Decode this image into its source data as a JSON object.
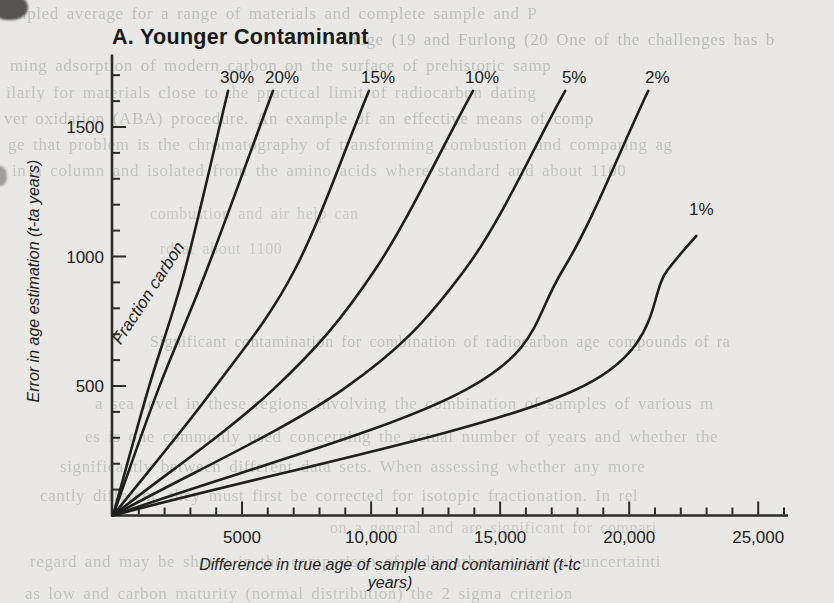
{
  "page": {
    "paper_color": "#e9e8e4",
    "ink_color": "#1f1f1d"
  },
  "chart_data": {
    "type": "line",
    "title": "A. Younger Contaminant",
    "xlabel": "Difference in true age of sample and contaminant (t-tc years)",
    "ylabel": "Error in age estimation (t-ta years)",
    "annotation": "Fraction carbon",
    "xlim": [
      0,
      26000
    ],
    "ylim": [
      0,
      1780
    ],
    "grid": false,
    "legend_position": "labels at upper end of each curve",
    "x_ticks_major": [
      {
        "value": 5000,
        "label": "5000"
      },
      {
        "value": 10000,
        "label": "10,000"
      },
      {
        "value": 15000,
        "label": "15,000"
      },
      {
        "value": 20000,
        "label": "20,000"
      },
      {
        "value": 25000,
        "label": "25,000"
      }
    ],
    "x_tick_minor_step": 1000,
    "y_ticks_major": [
      {
        "value": 500,
        "label": "500"
      },
      {
        "value": 1000,
        "label": "1000"
      },
      {
        "value": 1500,
        "label": "1500"
      }
    ],
    "y_tick_minor_step": 100,
    "series": [
      {
        "name": "30%",
        "fraction_carbon": 0.3,
        "points": [
          [
            0,
            0
          ],
          [
            1360,
            486
          ],
          [
            2790,
            950
          ],
          [
            4460,
            1640
          ]
        ],
        "label_pos": [
          4810,
          1695
        ]
      },
      {
        "name": "20%",
        "fraction_carbon": 0.2,
        "points": [
          [
            0,
            0
          ],
          [
            1750,
            486
          ],
          [
            3640,
            950
          ],
          [
            6200,
            1640
          ]
        ],
        "label_pos": [
          6550,
          1695
        ]
      },
      {
        "name": "15%",
        "fraction_carbon": 0.15,
        "points": [
          [
            0,
            0
          ],
          [
            3880,
            486
          ],
          [
            7050,
            950
          ],
          [
            9920,
            1640
          ]
        ],
        "label_pos": [
          10270,
          1695
        ]
      },
      {
        "name": "10%",
        "fraction_carbon": 0.1,
        "points": [
          [
            0,
            0
          ],
          [
            6200,
            486
          ],
          [
            10160,
            950
          ],
          [
            13950,
            1640
          ]
        ],
        "label_pos": [
          14300,
          1695
        ]
      },
      {
        "name": "5%",
        "fraction_carbon": 0.05,
        "points": [
          [
            0,
            0
          ],
          [
            8900,
            486
          ],
          [
            13640,
            950
          ],
          [
            17520,
            1640
          ]
        ],
        "label_pos": [
          17870,
          1695
        ]
      },
      {
        "name": "2%",
        "fraction_carbon": 0.02,
        "points": [
          [
            0,
            0
          ],
          [
            13680,
            486
          ],
          [
            17440,
            950
          ],
          [
            20740,
            1640
          ]
        ],
        "label_pos": [
          21090,
          1695
        ]
      },
      {
        "name": "1%",
        "fraction_carbon": 0.01,
        "points": [
          [
            0,
            0
          ],
          [
            17800,
            480
          ],
          [
            21500,
            950
          ],
          [
            22600,
            1080
          ]
        ],
        "label_pos": [
          22800,
          1185
        ]
      }
    ]
  },
  "ghost_lines": [
    {
      "text": "impled average for a range of materials and complete sample and P",
      "x": 8,
      "y": 4,
      "size": 17,
      "opacity": 0.55
    },
    {
      "text": "Indge (19   and Furlong (20   One of the challenges has b",
      "x": 342,
      "y": 30,
      "size": 17,
      "opacity": 0.6
    },
    {
      "text": "ming adsorption of modern carbon on the surface of prehistoric samp",
      "x": 10,
      "y": 56,
      "size": 17,
      "opacity": 0.55
    },
    {
      "text": "ilarly for materials close to the practical limit of radiocarbon dating",
      "x": 6,
      "y": 83,
      "size": 17,
      "opacity": 0.5
    },
    {
      "text": "ver oxidation (ABA) procedure. An example of an effective means of comp",
      "x": 4,
      "y": 109,
      "size": 17,
      "opacity": 0.55
    },
    {
      "text": "ge that problem is the chromatography of transforming combustion and comparing ag",
      "x": 8,
      "y": 135,
      "size": 17,
      "opacity": 0.5
    },
    {
      "text": "in a column and isolated from the amino acids where standard and about 1100",
      "x": 12,
      "y": 161,
      "size": 17,
      "opacity": 0.5
    },
    {
      "text": "combustion and air help can",
      "x": 150,
      "y": 205,
      "size": 16,
      "opacity": 0.42
    },
    {
      "text": "rd at about 1100",
      "x": 160,
      "y": 240,
      "size": 16,
      "opacity": 0.42
    },
    {
      "text": "Significant contamination for combination of radiocarbon age compounds of ra",
      "x": 150,
      "y": 333,
      "size": 16,
      "opacity": 0.55
    },
    {
      "text": "a sea level in these regions involving the combination of samples of various m",
      "x": 95,
      "y": 394,
      "size": 17,
      "opacity": 0.5
    },
    {
      "text": "es is one commonly used concerning the actual number of years and whether the",
      "x": 85,
      "y": 427,
      "size": 17,
      "opacity": 0.5
    },
    {
      "text": "significantly between different data sets. When assessing whether any more",
      "x": 60,
      "y": 457,
      "size": 17,
      "opacity": 0.5
    },
    {
      "text": "cantly different, they must first be corrected for isotopic fractionation. In rel",
      "x": 40,
      "y": 486,
      "size": 17,
      "opacity": 0.5
    },
    {
      "text": "on a general and are significant for compari",
      "x": 330,
      "y": 519,
      "size": 16,
      "opacity": 0.42
    },
    {
      "text": "regard and may be shown in the comparison of radiocarbon statistical uncertainti",
      "x": 30,
      "y": 552,
      "size": 17,
      "opacity": 0.5
    },
    {
      "text": "as low and carbon maturity (normal distribution) the 2 sigma criterion",
      "x": 25,
      "y": 584,
      "size": 17,
      "opacity": 0.5
    }
  ]
}
